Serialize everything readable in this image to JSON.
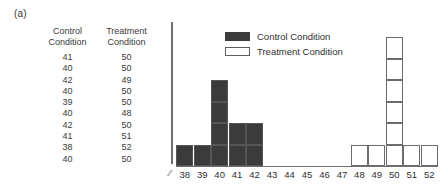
{
  "panel": {
    "label": "(a)"
  },
  "table": {
    "headers": [
      {
        "line1": "Control",
        "line2": "Condition"
      },
      {
        "line1": "Treatment",
        "line2": "Condition"
      }
    ],
    "rows": [
      {
        "control": "41",
        "treatment": "50"
      },
      {
        "control": "40",
        "treatment": "50"
      },
      {
        "control": "42",
        "treatment": "49"
      },
      {
        "control": "40",
        "treatment": "50"
      },
      {
        "control": "39",
        "treatment": "50"
      },
      {
        "control": "40",
        "treatment": "48"
      },
      {
        "control": "42",
        "treatment": "50"
      },
      {
        "control": "41",
        "treatment": "51"
      },
      {
        "control": "38",
        "treatment": "52"
      },
      {
        "control": "40",
        "treatment": "50"
      }
    ]
  },
  "legend": {
    "items": [
      {
        "label": "Control Condition",
        "swatch": "filled-dark"
      },
      {
        "label": "Treatment Condition",
        "swatch": "outlined-white"
      }
    ]
  },
  "axis_break_glyph": "//",
  "colors": {
    "control_fill": "#3b3b3b",
    "treatment_fill": "#ffffff",
    "treatment_stroke": "#6b6b6b",
    "axis": "#6f6f6f",
    "text": "#2f2f2f"
  },
  "chart_data": {
    "type": "bar",
    "title": "",
    "subtitle": "",
    "xlabel": "",
    "ylabel": "",
    "grid": false,
    "legend_position": "top-center",
    "axis_break": true,
    "categories": [
      "38",
      "39",
      "40",
      "41",
      "42",
      "43",
      "44",
      "45",
      "46",
      "47",
      "48",
      "49",
      "50",
      "51",
      "52"
    ],
    "xlim": [
      38,
      52
    ],
    "ylim": [
      0,
      6
    ],
    "series": [
      {
        "name": "Control Condition",
        "style": "stacked-blocks-filled",
        "values": [
          1,
          1,
          4,
          2,
          2,
          0,
          0,
          0,
          0,
          0,
          0,
          0,
          0,
          0,
          0
        ]
      },
      {
        "name": "Treatment Condition",
        "style": "stacked-blocks-outlined",
        "values": [
          0,
          0,
          0,
          0,
          0,
          0,
          0,
          0,
          0,
          0,
          1,
          1,
          6,
          1,
          1
        ]
      }
    ],
    "raw_values": {
      "control": [
        41,
        40,
        42,
        40,
        39,
        40,
        42,
        41,
        38,
        40
      ],
      "treatment": [
        50,
        50,
        49,
        50,
        50,
        48,
        50,
        51,
        52,
        50
      ]
    }
  }
}
